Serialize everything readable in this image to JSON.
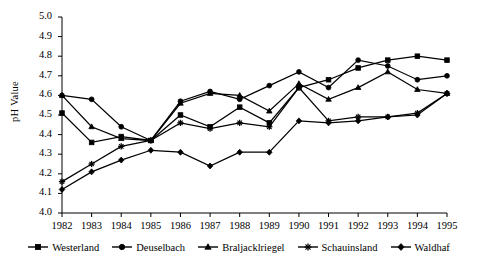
{
  "chart_data": {
    "type": "line",
    "title": "",
    "subtitle": "",
    "xlabel": "",
    "ylabel": "pH Value",
    "categories": [
      "1982",
      "1983",
      "1984",
      "1985",
      "1986",
      "1987",
      "1988",
      "1989",
      "1990",
      "1991",
      "1992",
      "1993",
      "1994",
      "1995"
    ],
    "x": [
      1982,
      1983,
      1984,
      1985,
      1986,
      1987,
      1988,
      1989,
      1990,
      1991,
      1992,
      1993,
      1994,
      1995
    ],
    "xlim": [
      1982,
      1995
    ],
    "ylim": [
      4.0,
      5.0
    ],
    "ytick_labels": [
      "5.0",
      "4.9",
      "4.8",
      "4.7",
      "4.6",
      "4.5",
      "4.4",
      "4.3",
      "4.2",
      "4.1",
      "4.0"
    ],
    "yticks": [
      5.0,
      4.9,
      4.8,
      4.7,
      4.6,
      4.5,
      4.4,
      4.3,
      4.2,
      4.1,
      4.0
    ],
    "ystep": 0.1,
    "grid": false,
    "legend_position": "bottom",
    "line_color": "#000000",
    "series": [
      {
        "name": "Westerland",
        "marker": "square",
        "values": [
          4.51,
          4.36,
          4.39,
          4.37,
          4.5,
          4.44,
          4.54,
          4.46,
          4.64,
          4.68,
          4.74,
          4.78,
          4.8,
          4.78
        ]
      },
      {
        "name": "Deuselbach",
        "marker": "circle",
        "values": [
          4.6,
          4.58,
          4.44,
          4.37,
          4.57,
          4.62,
          4.58,
          4.65,
          4.72,
          4.64,
          4.78,
          4.75,
          4.68,
          4.7
        ]
      },
      {
        "name": "Braljacklriegel",
        "marker": "triangle",
        "values": [
          4.6,
          4.44,
          4.38,
          4.37,
          4.56,
          4.61,
          4.6,
          4.52,
          4.66,
          4.58,
          4.64,
          4.72,
          4.63,
          4.61
        ]
      },
      {
        "name": "Schauinsland",
        "marker": "star",
        "values": [
          4.16,
          4.25,
          4.34,
          4.37,
          4.46,
          4.43,
          4.46,
          4.44,
          4.64,
          4.47,
          4.49,
          4.49,
          4.51,
          4.61
        ]
      },
      {
        "name": "Waldhaf",
        "marker": "diamond",
        "values": [
          4.12,
          4.21,
          4.27,
          4.32,
          4.31,
          4.24,
          4.31,
          4.31,
          4.47,
          4.46,
          4.47,
          4.49,
          4.5,
          4.61
        ]
      }
    ]
  },
  "legend": {
    "items": [
      {
        "label": "Westerland"
      },
      {
        "label": "Deuselbach"
      },
      {
        "label": "Braljacklriegel"
      },
      {
        "label": "Schauinsland"
      },
      {
        "label": "Waldhaf"
      }
    ]
  }
}
